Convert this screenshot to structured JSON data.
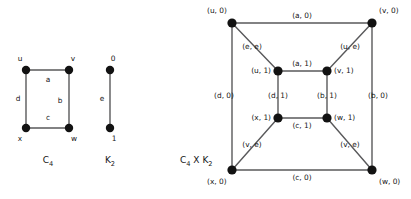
{
  "figure": {
    "title": "",
    "background_color": "#ffffff",
    "edge_color": "#59595b",
    "node_color": "#121212",
    "text_color": "#161616"
  },
  "graph_c4": {
    "caption": "C",
    "caption_sub": "4",
    "vertices": [
      {
        "id": "u",
        "label": "u"
      },
      {
        "id": "v",
        "label": "v"
      },
      {
        "id": "w",
        "label": "w"
      },
      {
        "id": "x",
        "label": "x"
      }
    ],
    "edges": [
      {
        "id": "a",
        "label": "a",
        "from": "u",
        "to": "v"
      },
      {
        "id": "b",
        "label": "b",
        "from": "v",
        "to": "w"
      },
      {
        "id": "c",
        "label": "c",
        "from": "x",
        "to": "w"
      },
      {
        "id": "d",
        "label": "d",
        "from": "u",
        "to": "x"
      }
    ]
  },
  "graph_k2": {
    "caption": "K",
    "caption_sub": "2",
    "vertices": [
      {
        "id": "0",
        "label": "0"
      },
      {
        "id": "1",
        "label": "1"
      }
    ],
    "edges": [
      {
        "id": "e",
        "label": "e",
        "from": "0",
        "to": "1"
      }
    ]
  },
  "graph_product": {
    "caption": "C",
    "caption_sub_1": "4",
    "caption_op": " X K",
    "caption_sub_2": "2",
    "outer_vertices": [
      {
        "id": "u0",
        "label": "(u, 0)"
      },
      {
        "id": "v0",
        "label": "(v, 0)"
      },
      {
        "id": "w0",
        "label": "(w, 0)"
      },
      {
        "id": "x0",
        "label": "(x, 0)"
      }
    ],
    "inner_vertices": [
      {
        "id": "u1",
        "label": "(u, 1)"
      },
      {
        "id": "v1",
        "label": "(v, 1)"
      },
      {
        "id": "w1",
        "label": "(w, 1)"
      },
      {
        "id": "x1",
        "label": "(x, 1)"
      }
    ],
    "outer_edges": [
      {
        "id": "a0",
        "label": "(a, 0)",
        "from": "u0",
        "to": "v0"
      },
      {
        "id": "b0",
        "label": "(b, 0)",
        "from": "v0",
        "to": "w0"
      },
      {
        "id": "c0",
        "label": "(c, 0)",
        "from": "x0",
        "to": "w0"
      },
      {
        "id": "d0",
        "label": "(d, 0)",
        "from": "u0",
        "to": "x0"
      }
    ],
    "inner_edges": [
      {
        "id": "a1",
        "label": "(a, 1)",
        "from": "u1",
        "to": "v1"
      },
      {
        "id": "b1",
        "label": "(b, 1)",
        "from": "v1",
        "to": "w1"
      },
      {
        "id": "c1",
        "label": "(c, 1)",
        "from": "x1",
        "to": "w1"
      },
      {
        "id": "d1",
        "label": "(d, 1)",
        "from": "u1",
        "to": "x1"
      }
    ],
    "cross_edges": [
      {
        "id": "ue",
        "label": "(e, e)",
        "from": "u0",
        "to": "u1"
      },
      {
        "id": "ve",
        "label": "(u, e)",
        "from": "v0",
        "to": "v1"
      },
      {
        "id": "xe",
        "label": "(v, e)",
        "from": "x0",
        "to": "x1"
      },
      {
        "id": "we",
        "label": "(v, e)",
        "from": "w0",
        "to": "w1"
      }
    ]
  }
}
